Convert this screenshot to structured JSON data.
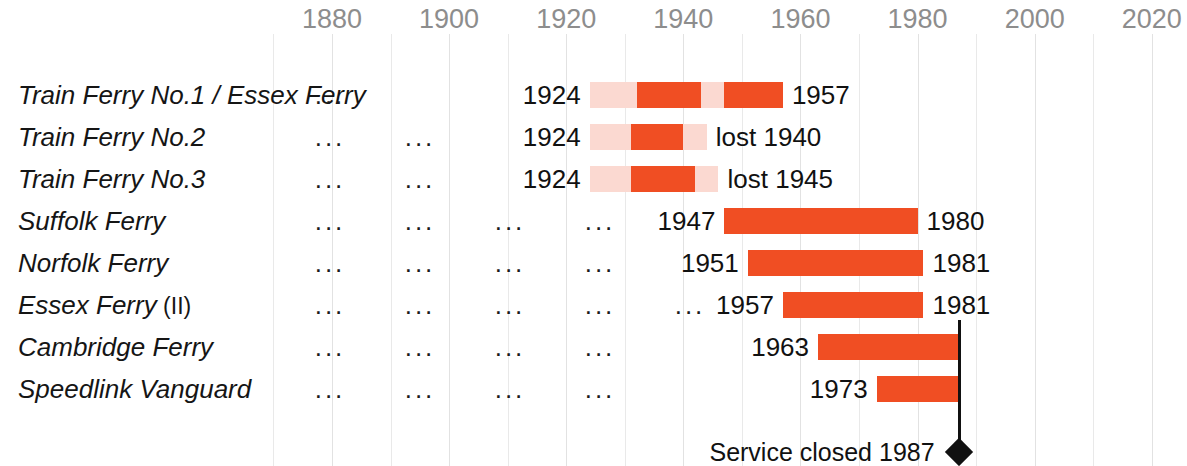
{
  "chart_data": {
    "type": "bar",
    "title": "",
    "subtitle": "",
    "xlabel": "",
    "ylabel": "",
    "orientation": "horizontal",
    "grid": true,
    "legend_position": "none",
    "axis": {
      "ticks": [
        "1880",
        "1900",
        "1920",
        "1940",
        "1960",
        "1980",
        "2000",
        "2020"
      ],
      "tick_values": [
        1880,
        1900,
        1920,
        1940,
        1960,
        1980,
        2000,
        2020
      ],
      "minor_tick_step": 10,
      "xlim": [
        1866,
        2026
      ]
    },
    "colors": {
      "bar_solid": "#f04e23",
      "bar_faded": "#fbd9d1",
      "axis_text": "#8d8d8d",
      "label_text": "#111111",
      "gridline": "#e9e9e9",
      "marker": "#111111"
    },
    "categories": [
      "Train Ferry No.1 / Essex Ferry",
      "Train Ferry No.2",
      "Train Ferry No.3",
      "Suffolk Ferry",
      "Norfolk Ferry",
      "Essex Ferry (II)",
      "Cambridge Ferry",
      "Speedlink Vanguard"
    ],
    "rows": [
      {
        "name": "Train Ferry No.1 / Essex Ferry",
        "name_suffix": "",
        "start_label": "1924",
        "end_label": "1957",
        "start_year": 1924,
        "end_year": 1957,
        "ellipses": [
          1
        ],
        "segments": [
          {
            "from": 1924,
            "to": 1932,
            "style": "faded"
          },
          {
            "from": 1932,
            "to": 1943,
            "style": "solid"
          },
          {
            "from": 1943,
            "to": 1947,
            "style": "faded"
          },
          {
            "from": 1947,
            "to": 1957,
            "style": "solid"
          }
        ]
      },
      {
        "name": "Train Ferry No.2",
        "name_suffix": "",
        "start_label": "1924",
        "end_label": "lost 1940",
        "start_year": 1924,
        "end_year": 1940,
        "ellipses": [
          1,
          2
        ],
        "segments": [
          {
            "from": 1924,
            "to": 1931,
            "style": "faded"
          },
          {
            "from": 1931,
            "to": 1940,
            "style": "solid"
          },
          {
            "from": 1940,
            "to": 1944,
            "style": "faded"
          }
        ]
      },
      {
        "name": "Train Ferry No.3",
        "name_suffix": "",
        "start_label": "1924",
        "end_label": "lost 1945",
        "start_year": 1924,
        "end_year": 1945,
        "ellipses": [
          1,
          2
        ],
        "segments": [
          {
            "from": 1924,
            "to": 1931,
            "style": "faded"
          },
          {
            "from": 1931,
            "to": 1942,
            "style": "solid"
          },
          {
            "from": 1942,
            "to": 1946,
            "style": "faded"
          }
        ]
      },
      {
        "name": "Suffolk Ferry",
        "name_suffix": "",
        "start_label": "1947",
        "end_label": "1980",
        "start_year": 1947,
        "end_year": 1980,
        "ellipses": [
          1,
          2,
          3,
          4
        ],
        "segments": [
          {
            "from": 1947,
            "to": 1980,
            "style": "solid"
          }
        ]
      },
      {
        "name": "Norfolk Ferry",
        "name_suffix": "",
        "start_label": "1951",
        "end_label": "1981",
        "start_year": 1951,
        "end_year": 1981,
        "ellipses": [
          1,
          2,
          3,
          4
        ],
        "segments": [
          {
            "from": 1951,
            "to": 1981,
            "style": "solid"
          }
        ]
      },
      {
        "name": "Essex Ferry",
        "name_suffix": "(II)",
        "start_label": "1957",
        "end_label": "1981",
        "start_year": 1957,
        "end_year": 1981,
        "ellipses": [
          1,
          2,
          3,
          4,
          5
        ],
        "segments": [
          {
            "from": 1957,
            "to": 1981,
            "style": "solid"
          }
        ]
      },
      {
        "name": "Cambridge Ferry",
        "name_suffix": "",
        "start_label": "1963",
        "end_label": "",
        "start_year": 1963,
        "end_year": 1987,
        "ellipses": [
          1,
          2,
          3,
          4
        ],
        "segments": [
          {
            "from": 1963,
            "to": 1987,
            "style": "solid"
          }
        ]
      },
      {
        "name": "Speedlink Vanguard",
        "name_suffix": "",
        "start_label": "1973",
        "end_label": "",
        "start_year": 1973,
        "end_year": 1987,
        "ellipses": [
          1,
          2,
          3,
          4
        ],
        "segments": [
          {
            "from": 1973,
            "to": 1987,
            "style": "solid"
          }
        ]
      }
    ],
    "annotations": [
      {
        "text": "Service closed 1987",
        "year": 1987,
        "marker": "diamond"
      }
    ]
  },
  "ellipsis_glyph": "..."
}
